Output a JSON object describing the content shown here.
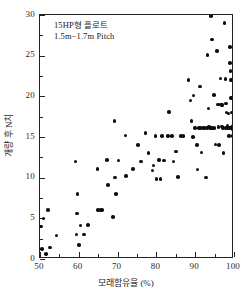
{
  "chart_data": {
    "type": "scatter",
    "title": "",
    "xlabel": "모래함유율 (%)",
    "ylabel": "개량 후 N치",
    "xlim": [
      50,
      100
    ],
    "ylim": [
      0,
      30
    ],
    "xticks": [
      50,
      60,
      70,
      80,
      90,
      100
    ],
    "xticklabels": [
      "50",
      "60",
      "70",
      "80",
      "90",
      "100"
    ],
    "yticks": [
      0,
      5,
      10,
      15,
      20,
      25,
      30
    ],
    "yticklabels": [
      "0",
      "5",
      "10",
      "15",
      "20",
      "25",
      "30"
    ],
    "grid": false,
    "legend": null,
    "marker": "filled-circle",
    "marker_color": "#0d0d0d",
    "annotations": [
      "15HP형 플로트",
      "1.5m−1.7m Pitch"
    ],
    "points": [
      [
        50.3,
        4.0
      ],
      [
        50.5,
        1.2
      ],
      [
        50.9,
        5.0
      ],
      [
        51.6,
        0.6
      ],
      [
        52.1,
        6.0
      ],
      [
        52.6,
        1.4
      ],
      [
        54.3,
        2.9
      ],
      [
        59.2,
        12.0
      ],
      [
        59.4,
        3.0
      ],
      [
        59.6,
        5.6
      ],
      [
        59.7,
        8.0
      ],
      [
        60.0,
        1.7
      ],
      [
        60.4,
        4.1
      ],
      [
        61.3,
        3.0
      ],
      [
        62.3,
        4.2
      ],
      [
        64.8,
        11.1
      ],
      [
        65.0,
        6.0
      ],
      [
        65.6,
        6.0
      ],
      [
        66.0,
        6.0
      ],
      [
        67.2,
        12.2
      ],
      [
        67.6,
        9.1
      ],
      [
        68.8,
        5.2
      ],
      [
        69.2,
        17.0
      ],
      [
        69.4,
        10.0
      ],
      [
        69.6,
        8.0
      ],
      [
        70.2,
        12.1
      ],
      [
        72.0,
        15.2
      ],
      [
        72.2,
        10.2
      ],
      [
        74.0,
        11.1
      ],
      [
        75.2,
        14.0
      ],
      [
        76.0,
        12.0
      ],
      [
        77.2,
        15.5
      ],
      [
        78.0,
        13.0
      ],
      [
        79.0,
        10.9
      ],
      [
        79.3,
        11.5
      ],
      [
        79.8,
        15.1
      ],
      [
        80.0,
        9.8
      ],
      [
        80.6,
        12.2
      ],
      [
        81.1,
        9.8
      ],
      [
        81.4,
        15.1
      ],
      [
        82.0,
        12.1
      ],
      [
        83.0,
        15.1
      ],
      [
        83.2,
        18.1
      ],
      [
        84.0,
        15.1
      ],
      [
        84.4,
        12.0
      ],
      [
        85.0,
        13.2
      ],
      [
        85.6,
        10.1
      ],
      [
        86.4,
        15.1
      ],
      [
        87.0,
        15.1
      ],
      [
        88.3,
        22.0
      ],
      [
        88.8,
        19.5
      ],
      [
        89.0,
        17.0
      ],
      [
        89.4,
        15.0
      ],
      [
        89.6,
        20.1
      ],
      [
        90.0,
        16.1
      ],
      [
        90.4,
        14.0
      ],
      [
        90.6,
        11.0
      ],
      [
        91.2,
        21.2
      ],
      [
        91.4,
        16.1
      ],
      [
        91.6,
        13.1
      ],
      [
        92.0,
        16.1
      ],
      [
        92.4,
        16.1
      ],
      [
        92.8,
        10.0
      ],
      [
        93.2,
        25.1
      ],
      [
        93.4,
        18.5
      ],
      [
        93.6,
        16.2
      ],
      [
        93.8,
        16.1
      ],
      [
        94.1,
        29.9
      ],
      [
        94.3,
        27.0
      ],
      [
        94.5,
        16.1
      ],
      [
        94.8,
        20.2
      ],
      [
        95.0,
        16.1
      ],
      [
        95.2,
        14.1
      ],
      [
        95.6,
        25.6
      ],
      [
        95.8,
        19.0
      ],
      [
        96.0,
        16.2
      ],
      [
        96.2,
        14.0
      ],
      [
        96.5,
        22.2
      ],
      [
        96.7,
        19.0
      ],
      [
        96.9,
        16.3
      ],
      [
        97.1,
        16.1
      ],
      [
        97.3,
        13.0
      ],
      [
        97.6,
        29.0
      ],
      [
        97.8,
        22.1
      ],
      [
        98.0,
        19.1
      ],
      [
        98.1,
        18.0
      ],
      [
        98.3,
        16.4
      ],
      [
        98.5,
        16.1
      ],
      [
        98.7,
        15.1
      ],
      [
        98.9,
        24.1
      ],
      [
        99.0,
        26.1
      ],
      [
        99.1,
        23.1
      ],
      [
        99.2,
        22.0
      ],
      [
        99.3,
        19.8
      ],
      [
        99.4,
        18.0
      ],
      [
        99.5,
        16.2
      ],
      [
        99.6,
        16.0
      ],
      [
        99.7,
        15.1
      ],
      [
        99.8,
        18.0
      ],
      [
        99.9,
        15.0
      ],
      [
        98.0,
        16.1
      ],
      [
        97.0,
        18.9
      ],
      [
        96.8,
        18.9
      ],
      [
        94.0,
        16.1
      ],
      [
        93.0,
        16.1
      ],
      [
        91.0,
        16.1
      ],
      [
        99.0,
        16.1
      ],
      [
        98.6,
        17.9
      ]
    ]
  }
}
